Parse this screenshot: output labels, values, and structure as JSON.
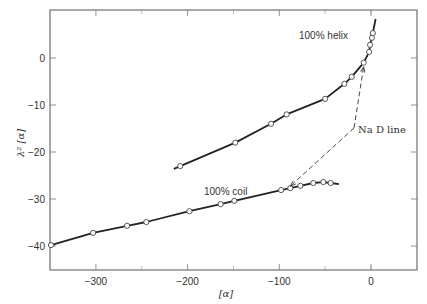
{
  "chart_data": {
    "type": "line",
    "title": "",
    "xlabel": "[α]",
    "ylabel": "λ² [α]",
    "xlim": [
      -350,
      50
    ],
    "ylim": [
      -45,
      10
    ],
    "grid": false,
    "legend": "none (inline annotations)",
    "x_ticks": [
      -300,
      -200,
      -100,
      0
    ],
    "x_minor_ticks": [
      -350,
      -250,
      -150,
      -50,
      0,
      50
    ],
    "y_ticks": [
      0,
      -10,
      -20,
      -30,
      -40
    ],
    "series": [
      {
        "name": "100% helix",
        "marker": "open circle",
        "curve_range_x": [
          -215,
          5
        ],
        "points": [
          {
            "x": -208,
            "y": -23.0
          },
          {
            "x": -148,
            "y": -18.0
          },
          {
            "x": -109,
            "y": -14.0
          },
          {
            "x": -92,
            "y": -12.0
          },
          {
            "x": -50,
            "y": -8.7
          },
          {
            "x": -29,
            "y": -5.5
          },
          {
            "x": -21,
            "y": -4.0
          },
          {
            "x": -8,
            "y": -1.0
          },
          {
            "x": -2,
            "y": 1.3
          },
          {
            "x": -1,
            "y": 2.8
          },
          {
            "x": 1,
            "y": 4.3
          },
          {
            "x": 2,
            "y": 5.3
          }
        ]
      },
      {
        "name": "100% coil",
        "marker": "open circle",
        "curve_range_x": [
          -350,
          -35
        ],
        "points": [
          {
            "x": -349,
            "y": -39.8
          },
          {
            "x": -303,
            "y": -37.2
          },
          {
            "x": -266,
            "y": -35.7
          },
          {
            "x": -245,
            "y": -34.9
          },
          {
            "x": -198,
            "y": -32.6
          },
          {
            "x": -164,
            "y": -31.1
          },
          {
            "x": -149,
            "y": -30.4
          },
          {
            "x": -98,
            "y": -28.1
          },
          {
            "x": -88,
            "y": -27.7
          },
          {
            "x": -77,
            "y": -27.2
          },
          {
            "x": -63,
            "y": -26.6
          },
          {
            "x": -52,
            "y": -26.4
          },
          {
            "x": -44,
            "y": -26.6
          }
        ]
      }
    ],
    "annotations": [
      {
        "text": "100% helix",
        "near": {
          "x": -70,
          "y": -2
        }
      },
      {
        "text": "100% coil",
        "near": {
          "x": -200,
          "y": -28
        }
      },
      {
        "text": "Na D line",
        "near": {
          "x": -15,
          "y": -16
        },
        "arrows_to": [
          {
            "x": -8,
            "y": -1
          },
          {
            "x": -88,
            "y": -27.7
          }
        ],
        "style": "dashed"
      }
    ]
  },
  "labels": {
    "helix": "100% helix",
    "coil": "100% coil",
    "nad": "Na D line",
    "xlabel": "[α]",
    "ylabel": "λ² [α]"
  }
}
